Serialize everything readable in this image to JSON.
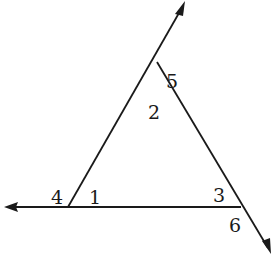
{
  "diagram": {
    "type": "triangle-with-extended-sides",
    "angle_labels": {
      "a1": "1",
      "a2": "2",
      "a3": "3",
      "a4": "4",
      "a5": "5",
      "a6": "6"
    },
    "colors": {
      "stroke": "#1a1a1a",
      "background": "#ffffff"
    }
  }
}
